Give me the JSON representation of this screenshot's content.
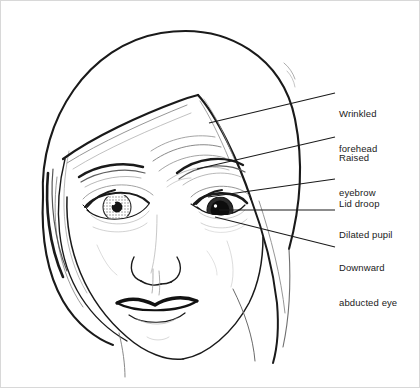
{
  "figure": {
    "background_color": "#ffffff",
    "ink_color": "#1a1a1a",
    "border_color": "#d8d8d8",
    "width": 420,
    "height": 388
  },
  "annotations": [
    {
      "id": "wrinkled-forehead",
      "line1": "Wrinkled",
      "line2": "forehead",
      "text_x": 338,
      "text_y": 84,
      "leader": {
        "x1": 334,
        "y1": 92,
        "x2": 208,
        "y2": 122
      }
    },
    {
      "id": "raised-eyebrow",
      "line1": "Raised",
      "line2": "eyebrow",
      "text_x": 338,
      "text_y": 128,
      "leader": {
        "x1": 334,
        "y1": 136,
        "x2": 196,
        "y2": 168
      }
    },
    {
      "id": "lid-droop",
      "line1": "Lid droop",
      "line2": "",
      "text_x": 338,
      "text_y": 174,
      "leader": {
        "x1": 334,
        "y1": 178,
        "x2": 207,
        "y2": 196
      }
    },
    {
      "id": "dilated-pupil",
      "line1": "Dilated pupil",
      "line2": "",
      "text_x": 338,
      "text_y": 205,
      "leader": {
        "x1": 334,
        "y1": 209,
        "x2": 218,
        "y2": 209
      }
    },
    {
      "id": "downward-abducted-eye",
      "line1": "Downward",
      "line2": "abducted eye",
      "text_x": 338,
      "text_y": 238,
      "leader": {
        "x1": 334,
        "y1": 246,
        "x2": 214,
        "y2": 216
      }
    }
  ],
  "features": {
    "normal_eye_side": "viewer-left",
    "affected_eye_side": "viewer-right",
    "hair_style": "long, side-parted with widow's peak",
    "mouth": "closed smile",
    "iris_shade": "#9a9a9a",
    "pupil_shade": "#101010"
  }
}
